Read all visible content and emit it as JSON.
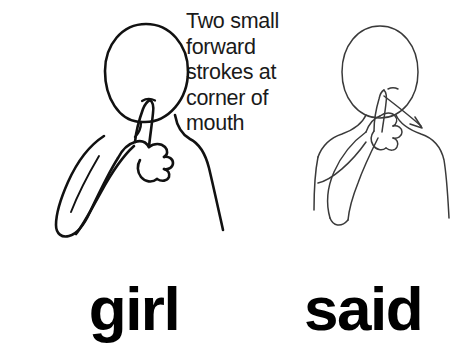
{
  "page": {
    "background_color": "#ffffff",
    "ink_color": "#000000",
    "type": "asl-sign-illustration"
  },
  "caption": {
    "text": "Two small\nforward\nstrokes at\ncorner of\nmouth",
    "lines": [
      "Two small",
      "forward",
      "strokes at",
      "corner of",
      "mouth"
    ]
  },
  "figures": [
    {
      "id": "girl",
      "name": "figure-girl",
      "description": "Line drawing of a person with an oval head, extended index finger of a closed fist touching the corner of the mouth, forearm angled down to the lower left.",
      "stroke_color": "#111111",
      "stroke_weight": "thick",
      "has_arrow": false
    },
    {
      "id": "said",
      "name": "figure-said",
      "description": "Line drawing of a person with an oval head, extended index finger of a closed fist touching the chin below the mouth, with a motion arrow pointing down and to the right.",
      "stroke_color": "#3a3a3a",
      "stroke_weight": "thin",
      "has_arrow": true
    }
  ],
  "labels": {
    "girl": "girl",
    "said": "said"
  }
}
